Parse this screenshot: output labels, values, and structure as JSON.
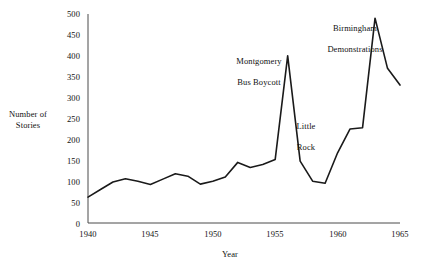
{
  "chart_data": {
    "type": "line",
    "title": "",
    "xlabel": "Year",
    "ylabel": "Number of\nStories",
    "ylabel_lines": [
      "Number of",
      "Stories"
    ],
    "xlim": [
      1940,
      1965
    ],
    "ylim": [
      0,
      500
    ],
    "grid": false,
    "legend": "none",
    "x_ticks": [
      "1940",
      "1945",
      "1950",
      "1955",
      "1960",
      "1965"
    ],
    "x_tick_values": [
      1940,
      1945,
      1950,
      1955,
      1960,
      1965
    ],
    "y_ticks": [
      "0",
      "50",
      "100",
      "150",
      "200",
      "250",
      "300",
      "350",
      "400",
      "450",
      "500"
    ],
    "y_tick_values": [
      0,
      50,
      100,
      150,
      200,
      250,
      300,
      350,
      400,
      450,
      500
    ],
    "x": [
      1940,
      1941,
      1942,
      1943,
      1944,
      1945,
      1946,
      1947,
      1948,
      1949,
      1950,
      1951,
      1952,
      1953,
      1954,
      1955,
      1956,
      1957,
      1958,
      1959,
      1960,
      1961,
      1962,
      1963,
      1964,
      1965
    ],
    "values": [
      62,
      80,
      98,
      106,
      100,
      92,
      105,
      118,
      112,
      93,
      100,
      110,
      145,
      133,
      140,
      152,
      400,
      148,
      100,
      95,
      168,
      225,
      228,
      490,
      370,
      330
    ],
    "series": [
      {
        "name": "Number of Stories",
        "values": [
          62,
          80,
          98,
          106,
          100,
          92,
          105,
          118,
          112,
          93,
          100,
          110,
          145,
          133,
          140,
          152,
          400,
          148,
          100,
          95,
          168,
          225,
          228,
          490,
          370,
          330
        ]
      }
    ],
    "annotations": [
      {
        "id": "montgomery",
        "text": "Montgomery\nBus Boycott",
        "lines": [
          "Montgomery",
          "Bus Boycott"
        ],
        "x": 1956,
        "y": 400
      },
      {
        "id": "little-rock",
        "text": "Little\nRock",
        "lines": [
          "Little",
          "Rock"
        ],
        "x": 1957,
        "y": 148
      },
      {
        "id": "birmingham",
        "text": "Birmingham\nDemonstrations",
        "lines": [
          "Birmingham",
          "Demonstrations"
        ],
        "x": 1963,
        "y": 490
      }
    ],
    "colors": {
      "line": "#1a1a1a",
      "axis": "#4a4a4a",
      "text": "#111111",
      "background": "#ffffff"
    }
  }
}
